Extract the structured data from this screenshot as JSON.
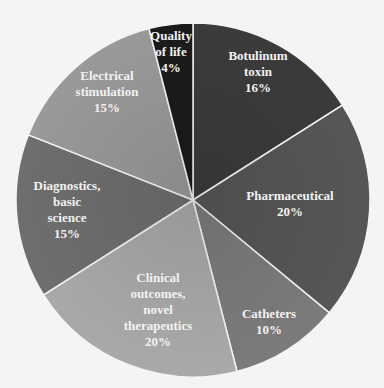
{
  "chart_data": {
    "type": "pie",
    "title": "",
    "categories": [
      "Botulinum toxin",
      "Pharmaceutical",
      "Catheters",
      "Clinical outcomes, novel therapeutics",
      "Diagnostics, basic science",
      "Electrical stimulation",
      "Quality of life"
    ],
    "values": [
      16,
      20,
      10,
      20,
      15,
      15,
      4
    ],
    "unit": "%",
    "start_angle_deg": 0,
    "direction": "clockwise",
    "legend": "none (labels inside slices)",
    "center": [
      193,
      200
    ],
    "radius": 177
  },
  "slices": [
    {
      "label_lines": [
        "Botulinum",
        "toxin",
        "16%"
      ],
      "value": 16,
      "color": "#3b3b3b",
      "label_pos": [
        258,
        60
      ]
    },
    {
      "label_lines": [
        "Pharmaceutical",
        "20%"
      ],
      "value": 20,
      "color": "#565656",
      "label_pos": [
        290,
        200
      ]
    },
    {
      "label_lines": [
        "Catheters",
        "10%"
      ],
      "value": 10,
      "color": "#7b7b7b",
      "label_pos": [
        269,
        318
      ]
    },
    {
      "label_lines": [
        "Clinical",
        "outcomes,",
        "novel",
        "therapeutics",
        "20%"
      ],
      "value": 20,
      "color": "#a9a9a9",
      "label_pos": [
        158,
        282
      ]
    },
    {
      "label_lines": [
        "Diagnostics,",
        "basic",
        "science",
        "15%"
      ],
      "value": 15,
      "color": "#6e6e6e",
      "label_pos": [
        67,
        190
      ]
    },
    {
      "label_lines": [
        "Electrical",
        "stimulation",
        "15%"
      ],
      "value": 15,
      "color": "#999999",
      "label_pos": [
        107,
        80
      ]
    },
    {
      "label_lines": [
        "Quality",
        "of life",
        "4%"
      ],
      "value": 4,
      "color": "#1b1b1b",
      "label_pos": [
        171,
        40
      ]
    }
  ],
  "colors": {
    "background": "#f4f4f2",
    "separator": "#f4f4f2",
    "label_text": "#f2f2f2"
  }
}
